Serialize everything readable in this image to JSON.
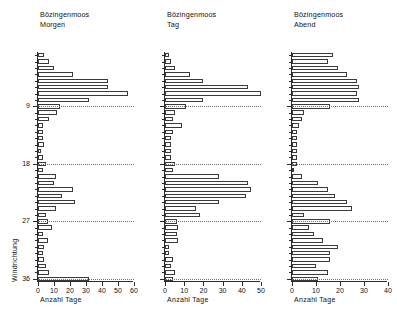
{
  "figure": {
    "station": "Bözingenmoos",
    "yaxis_title": "Windrichtung",
    "xaxis_title": "Anzahl Tage"
  },
  "chart_data": [
    {
      "type": "bar",
      "orientation": "horizontal",
      "title": "Bözingenmoos",
      "subtitle": "Morgen",
      "xlabel": "Anzahl Tage",
      "ylabel": "Windrichtung",
      "xlim": [
        0,
        60
      ],
      "xticks": [
        0,
        10,
        20,
        30,
        40,
        50,
        60
      ],
      "yticks_major": [
        9,
        18,
        27,
        36
      ],
      "ylim": [
        0,
        36
      ],
      "grid": "dotted horizontal reference lines at 9, 18, 27, 36",
      "categories": [
        1,
        2,
        3,
        4,
        5,
        6,
        7,
        8,
        9,
        10,
        11,
        12,
        13,
        14,
        15,
        16,
        17,
        18,
        19,
        20,
        21,
        22,
        23,
        24,
        25,
        26,
        27,
        28,
        29,
        30,
        31,
        32,
        33,
        34,
        35,
        36
      ],
      "values": [
        4,
        7,
        10,
        22,
        44,
        44,
        56,
        32,
        14,
        12,
        7,
        3,
        3,
        3,
        4,
        2,
        3,
        5,
        3,
        11,
        10,
        22,
        15,
        23,
        11,
        5,
        6,
        9,
        3,
        6,
        4,
        3,
        4,
        5,
        7,
        32
      ]
    },
    {
      "type": "bar",
      "orientation": "horizontal",
      "title": "Bözingenmoos",
      "subtitle": "Tag",
      "xlabel": "Anzahl Tage",
      "ylabel": "Windrichtung",
      "xlim": [
        0,
        50
      ],
      "xticks": [
        0,
        10,
        20,
        30,
        40,
        50
      ],
      "yticks_major": [
        9,
        18,
        27,
        36
      ],
      "ylim": [
        0,
        36
      ],
      "grid": "dotted horizontal reference lines at 9, 18, 27, 36",
      "categories": [
        1,
        2,
        3,
        4,
        5,
        6,
        7,
        8,
        9,
        10,
        11,
        12,
        13,
        14,
        15,
        16,
        17,
        18,
        19,
        20,
        21,
        22,
        23,
        24,
        25,
        26,
        27,
        28,
        29,
        30,
        31,
        32,
        33,
        34,
        35,
        36
      ],
      "values": [
        2,
        3,
        5,
        13,
        20,
        43,
        50,
        20,
        11,
        5,
        4,
        9,
        4,
        3,
        3,
        3,
        3,
        5,
        4,
        28,
        43,
        45,
        42,
        28,
        16,
        18,
        6,
        7,
        6,
        7,
        2,
        2,
        4,
        3,
        5,
        4
      ]
    },
    {
      "type": "bar",
      "orientation": "horizontal",
      "title": "Bözingenmoos",
      "subtitle": "Abend",
      "xlabel": "Anzahl Tage",
      "ylabel": "Windrichtung",
      "xlim": [
        0,
        40
      ],
      "xticks": [
        0,
        10,
        20,
        30,
        40
      ],
      "yticks_major": [
        9,
        18,
        27,
        36
      ],
      "ylim": [
        0,
        36
      ],
      "grid": "dotted horizontal reference lines at 9, 18, 27, 36",
      "categories": [
        1,
        2,
        3,
        4,
        5,
        6,
        7,
        8,
        9,
        10,
        11,
        12,
        13,
        14,
        15,
        16,
        17,
        18,
        19,
        20,
        21,
        22,
        23,
        24,
        25,
        26,
        27,
        28,
        29,
        30,
        31,
        32,
        33,
        34,
        35,
        36
      ],
      "values": [
        17,
        15,
        19,
        23,
        27,
        28,
        27,
        28,
        16,
        5,
        4,
        3,
        2,
        2,
        2,
        2,
        2,
        2,
        1,
        4,
        11,
        15,
        18,
        23,
        25,
        5,
        16,
        7,
        9,
        13,
        19,
        16,
        16,
        10,
        15,
        11
      ]
    }
  ],
  "panels": [
    {
      "title": "Bözingenmoos",
      "subtitle": "Morgen",
      "xaxis_title": "Anzahl Tage",
      "xticks": [
        "0",
        "10",
        "20",
        "30",
        "40",
        "50",
        "60"
      ],
      "yticks": [
        "9",
        "18",
        "27",
        "36"
      ],
      "yaxis_title": "Windrichtung"
    },
    {
      "title": "Bözingenmoos",
      "subtitle": "Tag",
      "xaxis_title": "Anzahl Tage",
      "xticks": [
        "0",
        "10",
        "20",
        "30",
        "40",
        "50"
      ],
      "yticks": [
        "9",
        "18",
        "27",
        "36"
      ]
    },
    {
      "title": "Bözingenmoos",
      "subtitle": "Abend",
      "xaxis_title": "Anzahl Tage",
      "xticks": [
        "0",
        "10",
        "20",
        "30",
        "40"
      ],
      "yticks": [
        "9",
        "18",
        "27",
        "36"
      ]
    }
  ]
}
